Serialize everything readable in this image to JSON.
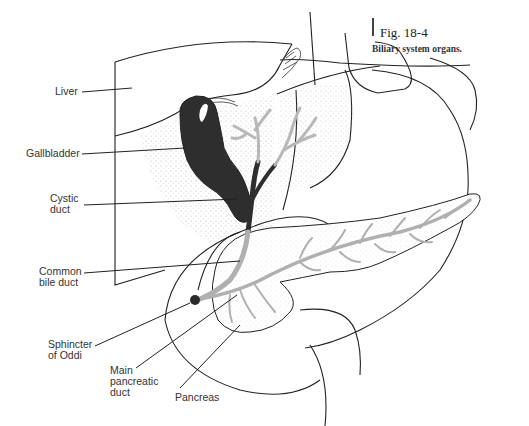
{
  "caption": {
    "figure_number": "Fig. 18-4",
    "title": "Biliary system organs."
  },
  "labels": {
    "liver": "Liver",
    "gallbladder": "Gallbladder",
    "cystic_duct_line1": "Cystic",
    "cystic_duct_line2": "duct",
    "common_bile_duct_line1": "Common",
    "common_bile_duct_line2": "bile duct",
    "sphincter_line1": "Sphincter",
    "sphincter_line2": "of Oddi",
    "main_pancreatic_duct_line1": "Main",
    "main_pancreatic_duct_line2": "pancreatic",
    "main_pancreatic_duct_line3": "duct",
    "pancreas": "Pancreas"
  },
  "colors": {
    "outline": "#222222",
    "gallbladder_fill": "#2e2e2e",
    "duct_gray": "#b5b5b5",
    "stipple": "#9a9a9a"
  }
}
